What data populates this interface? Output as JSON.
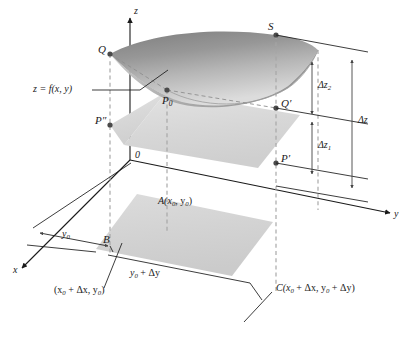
{
  "figure": {
    "kind": "3d-calculus-diagram",
    "colors": {
      "line": "#1a1a1a",
      "dashed": "#9a9a9a",
      "point": "#4d4d4d",
      "surface_dark": "#8d8d8d",
      "surface_light": "#d8d8d8",
      "plane_fill": "#d9d9d9",
      "base_fill": "#d5d5d5",
      "background": "#ffffff"
    }
  },
  "axes": {
    "z_label": "z",
    "y_label": "y",
    "x_label": "x",
    "origin_label": "0"
  },
  "surface": {
    "equation_label": "z = f(x, y)"
  },
  "points": {
    "Q": "Q",
    "S": "S",
    "P0": "P",
    "P0_sub": "0",
    "P_double_prime": "P″",
    "Q_prime": "Q′",
    "P_prime": "P′",
    "A": "A(x",
    "A_full": "A(x0, y0)",
    "B": "B",
    "C_full": "C(x0 + Δx, y0 + Δy)"
  },
  "labels": {
    "A_prefix": "A(x",
    "A_sub1": "0",
    "A_mid": ", y",
    "A_sub2": "0",
    "A_suffix": ")",
    "C_prefix": "C(x",
    "C_sub1": "0",
    "C_mid1": " + Δx, y",
    "C_sub2": "0",
    "C_mid2": " + Δy",
    "C_suffix": ")",
    "B_coord_prefix": "(x",
    "B_coord_sub1": "0",
    "B_coord_mid": " + Δx, y",
    "B_coord_sub2": "0",
    "B_coord_suffix": ")"
  },
  "dimensions": {
    "dz2_prefix": "Δz",
    "dz2_sub": "2",
    "dz1_prefix": "Δz",
    "dz1_sub": "1",
    "dz": "Δz",
    "y0_prefix": "y",
    "y0_sub": "0",
    "y0_dy_prefix": "y",
    "y0_dy_sub": "0",
    "y0_dy_suffix": " + Δy"
  }
}
